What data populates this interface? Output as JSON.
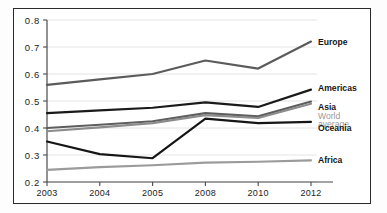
{
  "chart_data": {
    "type": "line",
    "title": "",
    "xlabel": "",
    "ylabel": "",
    "categories": [
      "2003",
      "2004",
      "2005",
      "2008",
      "2010",
      "2012"
    ],
    "ylim": [
      0.2,
      0.8
    ],
    "yticks": [
      "0.2",
      "0.3",
      "0.4",
      "0.5",
      "0.6",
      "0.7",
      "0.8"
    ],
    "grid": true,
    "legend_position": "right-of-plot-inline",
    "series": [
      {
        "name": "Europe",
        "color": "#5b5b5b",
        "values": [
          0.56,
          0.58,
          0.6,
          0.65,
          0.62,
          0.72
        ]
      },
      {
        "name": "Americas",
        "color": "#1a1a1a",
        "values": [
          0.455,
          0.465,
          0.475,
          0.495,
          0.478,
          0.542
        ]
      },
      {
        "name": "Asia",
        "color": "#5e5e5e",
        "values": [
          0.4,
          0.412,
          0.425,
          0.455,
          0.443,
          0.498
        ]
      },
      {
        "name": "World average",
        "color": "#8c8c8c",
        "values": [
          0.388,
          0.402,
          0.418,
          0.448,
          0.437,
          0.49
        ]
      },
      {
        "name": "Oceania",
        "color": "#161616",
        "values": [
          0.35,
          0.303,
          0.288,
          0.435,
          0.418,
          0.423
        ]
      },
      {
        "name": "Africa",
        "color": "#9b9b9b",
        "values": [
          0.245,
          0.255,
          0.262,
          0.272,
          0.275,
          0.28
        ]
      }
    ]
  },
  "axis": {
    "y_tick_labels": [
      "0.8",
      "0.7",
      "0.6",
      "0.5",
      "0.4",
      "0.3",
      "0.2"
    ],
    "x_tick_labels": [
      "2003",
      "2004",
      "2005",
      "2008",
      "2010",
      "2012"
    ]
  },
  "labels": {
    "europe": "Europe",
    "americas": "Americas",
    "asia": "Asia",
    "world_average_line1": "World",
    "world_average_line2": "average",
    "oceania": "Oceania",
    "africa": "Africa"
  }
}
